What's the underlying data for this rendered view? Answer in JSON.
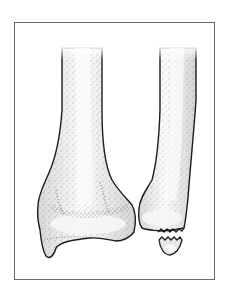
{
  "figure": {
    "annotations": [],
    "colors": {
      "outline": "#1c1c1c",
      "bone_fill": "#e9e9e9",
      "bone_highlight": "#fafafa",
      "stipple": "#4a4a4a",
      "frame_border": "#6a6a6a",
      "background": "#ffffff"
    },
    "elements": [
      {
        "name": "tibia",
        "region": "left"
      },
      {
        "name": "fibula",
        "region": "right"
      },
      {
        "name": "avulsed-fragment",
        "region": "fibula-tip"
      }
    ]
  }
}
